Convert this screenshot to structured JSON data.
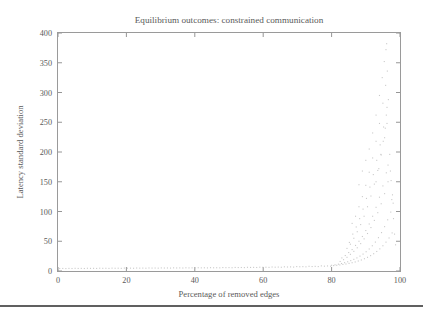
{
  "figure": {
    "background_color": "#ffffff",
    "bottom_rule_color": "#2b2b2b",
    "frame_color": "#9a9a9a",
    "point_color": "#c9c9c9"
  },
  "chart_data": {
    "type": "scatter",
    "title": "Equilibrium outcomes: constrained communication",
    "xlabel": "Percentage of removed edges",
    "ylabel": "Latency standard deviation",
    "xlim": [
      0,
      100
    ],
    "ylim": [
      0,
      400
    ],
    "xticks": [
      0,
      20,
      40,
      60,
      80,
      100
    ],
    "yticks": [
      0,
      50,
      100,
      150,
      200,
      250,
      300,
      350,
      400
    ],
    "xtick_labels": [
      "0",
      "20",
      "40",
      "60",
      "80",
      "100"
    ],
    "ytick_labels": [
      "0",
      "50",
      "100",
      "150",
      "200",
      "250",
      "300",
      "350",
      "400"
    ],
    "grid": false,
    "legend": null,
    "marker": "dot",
    "marker_size": 1,
    "points": [
      [
        0.5,
        4.2
      ],
      [
        1.4,
        4.3
      ],
      [
        2.3,
        4.1
      ],
      [
        3.2,
        4.4
      ],
      [
        4.1,
        4.2
      ],
      [
        5.0,
        4.5
      ],
      [
        5.9,
        4.3
      ],
      [
        6.8,
        4.4
      ],
      [
        7.7,
        4.2
      ],
      [
        8.6,
        4.6
      ],
      [
        9.5,
        4.4
      ],
      [
        10.4,
        4.5
      ],
      [
        11.3,
        4.3
      ],
      [
        12.2,
        4.7
      ],
      [
        13.1,
        4.5
      ],
      [
        14.0,
        4.6
      ],
      [
        14.9,
        4.4
      ],
      [
        15.8,
        4.8
      ],
      [
        16.7,
        4.6
      ],
      [
        17.6,
        4.7
      ],
      [
        18.5,
        4.5
      ],
      [
        19.4,
        4.9
      ],
      [
        20.3,
        4.7
      ],
      [
        21.2,
        4.8
      ],
      [
        22.1,
        4.6
      ],
      [
        23.0,
        5.0
      ],
      [
        23.9,
        4.8
      ],
      [
        24.8,
        4.9
      ],
      [
        25.7,
        4.7
      ],
      [
        26.6,
        5.1
      ],
      [
        27.5,
        4.9
      ],
      [
        28.4,
        5.0
      ],
      [
        29.3,
        4.8
      ],
      [
        30.2,
        5.2
      ],
      [
        31.1,
        5.0
      ],
      [
        32.0,
        5.1
      ],
      [
        32.9,
        4.9
      ],
      [
        33.8,
        5.3
      ],
      [
        34.7,
        5.1
      ],
      [
        35.6,
        5.2
      ],
      [
        36.5,
        5.0
      ],
      [
        37.4,
        5.4
      ],
      [
        38.3,
        5.2
      ],
      [
        39.2,
        5.3
      ],
      [
        40.1,
        5.1
      ],
      [
        41.0,
        5.5
      ],
      [
        41.9,
        5.3
      ],
      [
        42.8,
        5.4
      ],
      [
        43.7,
        5.2
      ],
      [
        44.6,
        5.6
      ],
      [
        45.5,
        5.4
      ],
      [
        46.4,
        5.5
      ],
      [
        47.3,
        5.3
      ],
      [
        48.2,
        5.8
      ],
      [
        49.1,
        5.6
      ],
      [
        50.0,
        5.7
      ],
      [
        50.9,
        5.5
      ],
      [
        51.8,
        6.0
      ],
      [
        52.7,
        5.8
      ],
      [
        53.6,
        5.9
      ],
      [
        54.5,
        5.7
      ],
      [
        55.4,
        6.2
      ],
      [
        56.3,
        6.0
      ],
      [
        57.2,
        6.1
      ],
      [
        58.1,
        5.9
      ],
      [
        59.0,
        6.4
      ],
      [
        59.9,
        6.2
      ],
      [
        60.8,
        6.3
      ],
      [
        61.7,
        6.1
      ],
      [
        62.6,
        6.7
      ],
      [
        63.5,
        6.4
      ],
      [
        64.4,
        6.6
      ],
      [
        65.3,
        6.3
      ],
      [
        66.2,
        7.0
      ],
      [
        67.1,
        6.7
      ],
      [
        68.0,
        6.9
      ],
      [
        68.9,
        6.6
      ],
      [
        69.8,
        7.4
      ],
      [
        70.7,
        7.1
      ],
      [
        71.6,
        7.3
      ],
      [
        72.5,
        7.0
      ],
      [
        73.4,
        7.9
      ],
      [
        74.3,
        7.5
      ],
      [
        75.2,
        7.8
      ],
      [
        76.1,
        7.4
      ],
      [
        77.0,
        8.6
      ],
      [
        77.9,
        8.1
      ],
      [
        78.8,
        8.5
      ],
      [
        79.7,
        8.0
      ],
      [
        80.0,
        9.6
      ],
      [
        80.6,
        9.1
      ],
      [
        81.0,
        10.4
      ],
      [
        81.5,
        9.6
      ],
      [
        82.0,
        11.5
      ],
      [
        82.4,
        10.2
      ],
      [
        82.9,
        12.6
      ],
      [
        83.3,
        11.0
      ],
      [
        83.8,
        14.0
      ],
      [
        84.2,
        11.8
      ],
      [
        84.7,
        15.5
      ],
      [
        85.1,
        12.8
      ],
      [
        85.6,
        17.4
      ],
      [
        86.0,
        13.9
      ],
      [
        86.5,
        19.6
      ],
      [
        86.9,
        15.2
      ],
      [
        87.4,
        22.0
      ],
      [
        87.8,
        16.8
      ],
      [
        88.3,
        25.0
      ],
      [
        88.7,
        18.5
      ],
      [
        89.2,
        28.4
      ],
      [
        89.6,
        20.6
      ],
      [
        90.1,
        32.4
      ],
      [
        90.5,
        23.0
      ],
      [
        91.0,
        37.0
      ],
      [
        91.4,
        25.8
      ],
      [
        91.9,
        42.4
      ],
      [
        92.3,
        29.0
      ],
      [
        92.8,
        48.6
      ],
      [
        93.2,
        32.8
      ],
      [
        93.7,
        56.0
      ],
      [
        94.1,
        37.2
      ],
      [
        94.6,
        64.5
      ],
      [
        95.0,
        42.4
      ],
      [
        95.5,
        74.5
      ],
      [
        95.9,
        48.5
      ],
      [
        96.4,
        86.0
      ],
      [
        96.8,
        55.5
      ],
      [
        97.3,
        99.0
      ],
      [
        97.7,
        64.0
      ],
      [
        98.0,
        114.0
      ],
      [
        83.0,
        22.0
      ],
      [
        84.0,
        26.0
      ],
      [
        85.0,
        31.0
      ],
      [
        86.0,
        36.0
      ],
      [
        87.0,
        43.0
      ],
      [
        88.0,
        50.0
      ],
      [
        89.0,
        58.0
      ],
      [
        90.0,
        68.0
      ],
      [
        91.0,
        79.0
      ],
      [
        92.0,
        92.0
      ],
      [
        93.0,
        107.0
      ],
      [
        94.0,
        124.0
      ],
      [
        95.0,
        143.0
      ],
      [
        96.0,
        165.0
      ],
      [
        96.5,
        178.0
      ],
      [
        85.5,
        45.0
      ],
      [
        86.5,
        55.0
      ],
      [
        87.5,
        66.0
      ],
      [
        88.5,
        78.0
      ],
      [
        89.5,
        92.0
      ],
      [
        90.5,
        108.0
      ],
      [
        91.5,
        126.0
      ],
      [
        92.5,
        146.0
      ],
      [
        93.5,
        169.0
      ],
      [
        94.5,
        195.0
      ],
      [
        95.5,
        224.0
      ],
      [
        96.2,
        248.0
      ],
      [
        88.0,
        108.0
      ],
      [
        89.0,
        125.0
      ],
      [
        90.0,
        144.0
      ],
      [
        91.0,
        166.0
      ],
      [
        92.0,
        190.0
      ],
      [
        93.0,
        218.0
      ],
      [
        94.0,
        248.0
      ],
      [
        95.0,
        282.0
      ],
      [
        95.8,
        312.0
      ],
      [
        96.3,
        336.0
      ],
      [
        91.0,
        205.0
      ],
      [
        92.0,
        232.0
      ],
      [
        93.0,
        262.0
      ],
      [
        94.0,
        295.0
      ],
      [
        94.8,
        325.0
      ],
      [
        95.4,
        352.0
      ],
      [
        95.9,
        372.0
      ],
      [
        96.1,
        382.0
      ],
      [
        93.0,
        150.0
      ],
      [
        93.8,
        172.0
      ],
      [
        94.4,
        196.0
      ],
      [
        95.1,
        218.0
      ],
      [
        95.7,
        240.0
      ],
      [
        96.0,
        262.0
      ],
      [
        96.6,
        288.0
      ],
      [
        97.0,
        196.0
      ],
      [
        97.4,
        152.0
      ],
      [
        97.8,
        128.0
      ],
      [
        86.0,
        80.0
      ],
      [
        87.0,
        92.0
      ],
      [
        88.0,
        145.0
      ],
      [
        89.0,
        168.0
      ],
      [
        90.0,
        186.0
      ],
      [
        84.5,
        38.0
      ],
      [
        85.2,
        48.0
      ],
      [
        86.2,
        62.0
      ],
      [
        87.2,
        74.0
      ],
      [
        88.2,
        88.0
      ],
      [
        89.2,
        104.0
      ],
      [
        90.2,
        122.0
      ],
      [
        91.2,
        141.0
      ],
      [
        92.2,
        162.0
      ],
      [
        93.2,
        186.0
      ],
      [
        94.2,
        212.0
      ],
      [
        95.2,
        242.0
      ],
      [
        96.2,
        275.0
      ],
      [
        82.5,
        16.0
      ],
      [
        83.5,
        19.0
      ],
      [
        84.5,
        23.0
      ],
      [
        85.5,
        28.0
      ],
      [
        86.5,
        33.0
      ],
      [
        87.5,
        39.0
      ],
      [
        88.5,
        46.0
      ],
      [
        89.5,
        54.0
      ],
      [
        90.5,
        63.0
      ],
      [
        91.5,
        73.0
      ],
      [
        92.5,
        85.0
      ],
      [
        93.5,
        98.0
      ],
      [
        94.5,
        113.0
      ],
      [
        95.5,
        130.0
      ],
      [
        96.5,
        150.0
      ],
      [
        97.2,
        168.0
      ],
      [
        97.6,
        120.0
      ],
      [
        98.1,
        88.0
      ],
      [
        98.4,
        62.0
      ],
      [
        98.7,
        44.0
      ]
    ]
  }
}
